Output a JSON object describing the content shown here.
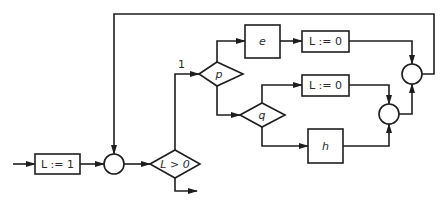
{
  "diagram": {
    "type": "flowchart",
    "nodes": {
      "init": {
        "label": "L := 1",
        "shape": "rectangle"
      },
      "join_main": {
        "label": "",
        "shape": "circle"
      },
      "test_L": {
        "label": "L > 0",
        "shape": "diamond"
      },
      "test_p": {
        "label": "p",
        "shape": "diamond"
      },
      "box_e": {
        "label": "e",
        "shape": "rectangle"
      },
      "assign_top": {
        "label": "L := 0",
        "shape": "rectangle"
      },
      "test_q": {
        "label": "q",
        "shape": "diamond"
      },
      "assign_mid": {
        "label": "L := 0",
        "shape": "rectangle"
      },
      "box_h": {
        "label": "h",
        "shape": "rectangle"
      },
      "join_lower": {
        "label": "",
        "shape": "circle"
      },
      "join_upper": {
        "label": "",
        "shape": "circle"
      }
    },
    "edge_labels": {
      "true_branch": "1"
    },
    "edges": [
      [
        "entry",
        "init"
      ],
      [
        "init",
        "join_main"
      ],
      [
        "join_main",
        "test_L"
      ],
      [
        "test_L",
        "test_p"
      ],
      [
        "test_L",
        "exit"
      ],
      [
        "test_p",
        "box_e"
      ],
      [
        "box_e",
        "assign_top"
      ],
      [
        "assign_top",
        "join_upper"
      ],
      [
        "test_p",
        "test_q"
      ],
      [
        "test_q",
        "assign_mid"
      ],
      [
        "test_q",
        "box_h"
      ],
      [
        "assign_mid",
        "join_lower"
      ],
      [
        "box_h",
        "join_lower"
      ],
      [
        "join_lower",
        "join_upper"
      ],
      [
        "join_upper",
        "join_main"
      ]
    ],
    "colors": {
      "stroke": "#1e1e1e",
      "background": "#ffffff"
    }
  }
}
